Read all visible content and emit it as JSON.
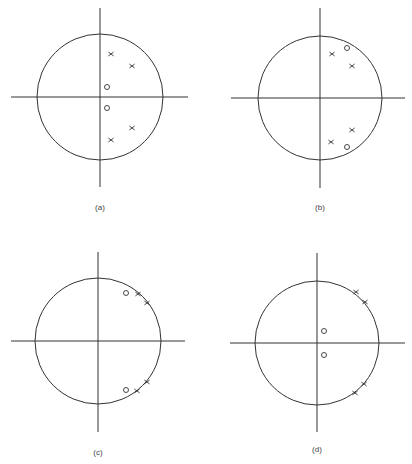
{
  "chart_data": [
    {
      "type": "scatter",
      "title": "",
      "label": "(a)",
      "description": "Pole-zero plot in z-plane with unit circle",
      "center": [
        100,
        97
      ],
      "radius": 63,
      "axes": {
        "x": [
          11,
          188
        ],
        "y": [
          8,
          187
        ]
      },
      "poles": [
        [
          111,
          54
        ],
        [
          132,
          66
        ],
        [
          132,
          128
        ],
        [
          111,
          140
        ]
      ],
      "zeros": [
        [
          107,
          87
        ],
        [
          107,
          108
        ]
      ],
      "label_pos": [
        100,
        210
      ]
    },
    {
      "type": "scatter",
      "title": "",
      "label": "(b)",
      "description": "Pole-zero plot in z-plane with unit circle",
      "center": [
        320,
        98
      ],
      "radius": 62,
      "axes": {
        "x": [
          231,
          405
        ],
        "y": [
          8,
          188
        ]
      },
      "poles": [
        [
          332,
          54
        ],
        [
          352,
          66
        ],
        [
          352,
          130
        ],
        [
          331,
          142
        ]
      ],
      "zeros": [
        [
          347,
          48
        ],
        [
          347,
          147
        ]
      ],
      "label_pos": [
        320,
        210
      ]
    },
    {
      "type": "scatter",
      "title": "",
      "label": "(c)",
      "description": "Pole-zero plot in z-plane with unit circle, poles on circle",
      "center": [
        98,
        341
      ],
      "radius": 63,
      "axes": {
        "x": [
          11,
          185
        ],
        "y": [
          252,
          432
        ]
      },
      "poles": [
        [
          138,
          294
        ],
        [
          147,
          303
        ],
        [
          147,
          382
        ],
        [
          137,
          391
        ]
      ],
      "zeros": [
        [
          126,
          293
        ],
        [
          126,
          390
        ]
      ],
      "label_pos": [
        98,
        455
      ]
    },
    {
      "type": "scatter",
      "title": "",
      "label": "(d)",
      "description": "Pole-zero plot in z-plane with unit circle, poles on circle",
      "center": [
        317,
        343
      ],
      "radius": 62,
      "axes": {
        "x": [
          230,
          405
        ],
        "y": [
          253,
          432
        ]
      },
      "poles": [
        [
          356,
          292
        ],
        [
          365,
          302
        ],
        [
          364,
          384
        ],
        [
          355,
          393
        ]
      ],
      "zeros": [
        [
          324,
          331
        ],
        [
          324,
          355
        ]
      ],
      "label_pos": [
        317,
        452
      ]
    }
  ],
  "plots": [
    {
      "label": "(a)"
    },
    {
      "label": "(b)"
    },
    {
      "label": "(c)"
    },
    {
      "label": "(d)"
    }
  ]
}
